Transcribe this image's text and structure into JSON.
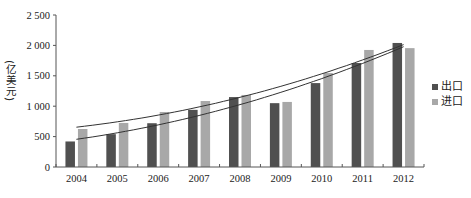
{
  "chart_data": {
    "type": "bar",
    "title": "",
    "xlabel": "",
    "ylabel": "(亿美元)",
    "ylim": [
      0,
      2500
    ],
    "yticks": [
      0,
      500,
      1000,
      1500,
      2000,
      2500
    ],
    "ytick_labels": [
      "0",
      "500",
      "1 000",
      "1 500",
      "2 000",
      "2 500"
    ],
    "grid": false,
    "legend_position": "right",
    "categories": [
      "2004",
      "2005",
      "2006",
      "2007",
      "2008",
      "2009",
      "2010",
      "2011",
      "2012"
    ],
    "series": [
      {
        "name": "出口",
        "color": "#505050",
        "values": [
          420,
          540,
          720,
          940,
          1150,
          1050,
          1380,
          1710,
          2040
        ]
      },
      {
        "name": "进口",
        "color": "#a8a8a8",
        "values": [
          625,
          725,
          905,
          1085,
          1185,
          1070,
          1545,
          1925,
          1955
        ]
      }
    ],
    "trendlines": [
      {
        "series": "出口",
        "type": "polynomial",
        "start": 405,
        "end": 2045
      },
      {
        "series": "进口",
        "type": "polynomial",
        "start": 660,
        "end": 2045
      }
    ]
  },
  "legend": {
    "items": [
      {
        "label": "出口",
        "color": "#505050"
      },
      {
        "label": "进口",
        "color": "#a8a8a8"
      }
    ]
  },
  "axis": {
    "ylabel": "(亿美元)"
  }
}
